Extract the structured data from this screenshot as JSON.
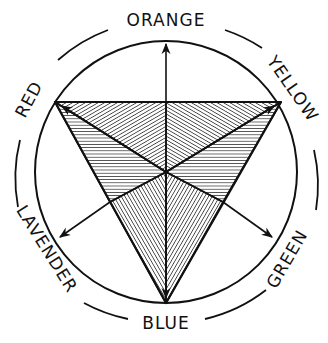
{
  "diagram": {
    "type": "color-wheel",
    "center": [
      166,
      172
    ],
    "inner_circle_radius": 131,
    "outer_ring_radius": 159,
    "labels": {
      "orange": "ORANGE",
      "yellow": "YELLOW",
      "green": "GREEN",
      "blue": "BLUE",
      "lavender": "LAVENDER",
      "red": "RED"
    },
    "primaries": [
      "RED",
      "YELLOW",
      "BLUE"
    ],
    "secondaries": [
      "ORANGE",
      "GREEN",
      "LAVENDER"
    ],
    "triangle_vertices": {
      "red": [
        55,
        102
      ],
      "yellow": [
        281,
        102
      ],
      "blue": [
        166,
        303
      ]
    },
    "arrows": [
      {
        "from": "center",
        "to": "ORANGE"
      },
      {
        "from": "center",
        "to": "LAVENDER"
      },
      {
        "from": "center",
        "to": "GREEN"
      },
      {
        "from": "center",
        "to": "RED"
      },
      {
        "from": "center",
        "to": "YELLOW"
      },
      {
        "from": "center",
        "to": "BLUE"
      }
    ],
    "colors": {
      "ink": "#111111",
      "paper": "#ffffff"
    }
  }
}
